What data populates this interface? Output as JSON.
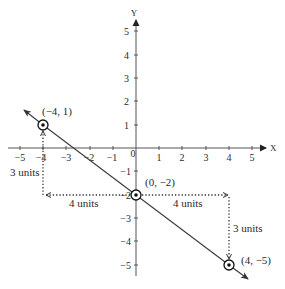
{
  "diagram": {
    "type": "coordinate-plane",
    "axes": {
      "x_label": "X",
      "y_label": "Y",
      "x_ticks": [
        "−5",
        "−4",
        "−3",
        "−2",
        "−1",
        "0",
        "1",
        "2",
        "3",
        "4",
        "5"
      ],
      "y_ticks_positive": [
        "5",
        "4",
        "3",
        "2",
        "1"
      ],
      "y_ticks_negative": [
        "−1",
        "−2",
        "−3",
        "−4",
        "−5"
      ],
      "range": {
        "xmin": -5,
        "xmax": 5,
        "ymin": -5,
        "ymax": 5
      }
    },
    "line": {
      "description": "line through (-4, 1), (0, -2), (4, -5)",
      "slope": "-3/4",
      "color": "#3a3a3a"
    },
    "points": [
      {
        "label": "(−4, 1)",
        "x": -4,
        "y": 1
      },
      {
        "label": "(0, −2)",
        "x": 0,
        "y": -2
      },
      {
        "label": "(4, −5)",
        "x": 4,
        "y": -5
      }
    ],
    "annotations": [
      {
        "label": "3 units",
        "description": "vertical rise from (-4,-2) up to (-4,1)"
      },
      {
        "label": "4 units",
        "description": "horizontal run from (0,-2) left to (-4,-2)"
      },
      {
        "label": "4 units",
        "description": "horizontal run from (0,-2) right to (4,-2)"
      },
      {
        "label": "3 units",
        "description": "vertical drop from (4,-2) down to (4,-5)"
      }
    ]
  }
}
